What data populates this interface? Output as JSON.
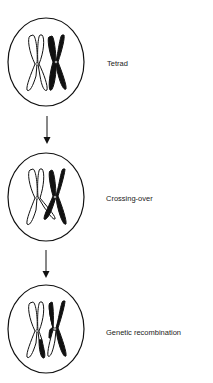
{
  "colors": {
    "stroke": "#111111",
    "background": "#ffffff",
    "text": "#222222"
  },
  "stages": [
    {
      "label": "Tetrad",
      "label_x": 107,
      "label_y": 60,
      "circle": {
        "cx": 46,
        "cy": 62,
        "rx": 38,
        "ry": 44
      }
    },
    {
      "label": "Crossing-over",
      "label_x": 106,
      "label_y": 195,
      "circle": {
        "cx": 46,
        "cy": 197,
        "rx": 38,
        "ry": 44
      }
    },
    {
      "label": "Genetic recombination",
      "label_x": 106,
      "label_y": 329,
      "circle": {
        "cx": 46,
        "cy": 329,
        "rx": 38,
        "ry": 44
      }
    }
  ],
  "arrows": [
    {
      "x": 47,
      "y1": 116,
      "y2": 144,
      "icon": "arrow-down-icon"
    },
    {
      "x": 46,
      "y1": 250,
      "y2": 278,
      "icon": "arrow-down-icon"
    }
  ]
}
